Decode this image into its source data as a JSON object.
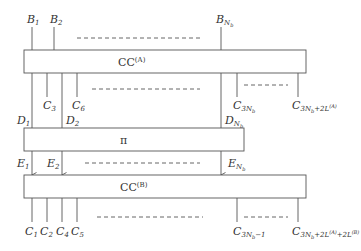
{
  "diagram": {
    "boxes": {
      "cc_a": {
        "label": "CC",
        "sup": "(A)"
      },
      "pi": {
        "label": "π"
      },
      "cc_b": {
        "label": "CC",
        "sup": "(B)"
      }
    },
    "inputs_b": [
      {
        "base": "B",
        "sub": "1"
      },
      {
        "base": "B",
        "sub": "2"
      },
      {
        "base": "B",
        "sub": "N",
        "subsub": "b"
      }
    ],
    "outputs_a": [
      {
        "base": "C",
        "sub": "3"
      },
      {
        "base": "C",
        "sub": "6"
      },
      {
        "base": "C",
        "sub": "3N",
        "subsub": "b"
      },
      {
        "base": "C",
        "sub": "3N",
        "subsub": "b",
        "tail": "+2L",
        "tailsup": "(A)"
      }
    ],
    "inputs_d": [
      {
        "base": "D",
        "sub": "1"
      },
      {
        "base": "D",
        "sub": "2"
      },
      {
        "base": "D",
        "sub": "N",
        "subsub": "b"
      }
    ],
    "inputs_e": [
      {
        "base": "E",
        "sub": "1"
      },
      {
        "base": "E",
        "sub": "2"
      },
      {
        "base": "E",
        "sub": "N",
        "subsub": "b"
      }
    ],
    "outputs_b": [
      {
        "base": "C",
        "sub": "1"
      },
      {
        "base": "C",
        "sub": "2"
      },
      {
        "base": "C",
        "sub": "4"
      },
      {
        "base": "C",
        "sub": "5"
      },
      {
        "base": "C",
        "sub": "3N",
        "subsub": "b",
        "tail": "−1"
      },
      {
        "base": "C",
        "sub": "3N",
        "subsub": "b",
        "tail": "+2L",
        "tailsup": "(A)",
        "tail2": "+2L",
        "tail2sup": "(B)"
      }
    ]
  }
}
